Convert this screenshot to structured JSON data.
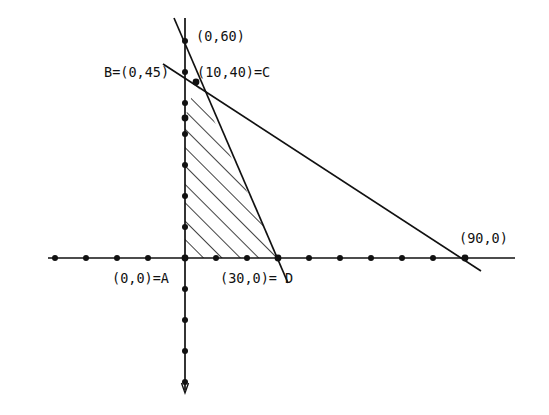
{
  "figure": {
    "width": 549,
    "height": 415,
    "background_color": "#ffffff",
    "line_color": "#111111",
    "text_color": "#111111"
  },
  "axes": {
    "origin_px": {
      "x": 185,
      "y": 258
    },
    "units_per_tick": 10,
    "pixels_per_tick": 31,
    "x_axis": {
      "name": "horizontal-axis",
      "start_px": 48,
      "end_px": 515,
      "tick_dot_positions_px": [
        55,
        86,
        117,
        148,
        185,
        216,
        247,
        278,
        309,
        340,
        371,
        402,
        433,
        465
      ],
      "has_arrow": false
    },
    "y_axis": {
      "name": "vertical-axis",
      "top_px": 18,
      "bottom_px": 393,
      "tick_dot_positions_px": [
        41,
        72,
        103,
        134,
        165,
        196,
        227,
        289,
        320,
        351,
        382
      ],
      "has_arrow": true,
      "arrow_direction": "down"
    }
  },
  "labels": [
    {
      "id": "label-0-60",
      "text": "(0,60)",
      "x": 196,
      "y": 30,
      "anchor": "left"
    },
    {
      "id": "label-b",
      "text": "B=(0,45)",
      "x": 104,
      "y": 66,
      "anchor": "left"
    },
    {
      "id": "label-c",
      "text": "(10,40)=C",
      "x": 197,
      "y": 66,
      "anchor": "left"
    },
    {
      "id": "label-a",
      "text": "(0,0)=A",
      "x": 112,
      "y": 272,
      "anchor": "left"
    },
    {
      "id": "label-d",
      "text": "(30,0)= D",
      "x": 220,
      "y": 272,
      "anchor": "left"
    },
    {
      "id": "label-90-0",
      "text": "(90,0)",
      "x": 459,
      "y": 232,
      "anchor": "left"
    }
  ],
  "constraint_lines": [
    {
      "id": "line-through-0-60-and-30-0",
      "name": "steep-constraint-line",
      "description": "Line from (0,60) down through (30,0)=D",
      "from_px": {
        "x": 174,
        "y": 18
      },
      "to_px": {
        "x": 288,
        "y": 283
      }
    },
    {
      "id": "line-through-0-45-and-90-0",
      "name": "shallow-constraint-line",
      "description": "Line from (0,45)=B down through (90,0)",
      "from_px": {
        "x": 163,
        "y": 64
      },
      "to_px": {
        "x": 481,
        "y": 271
      }
    }
  ],
  "vertices": [
    {
      "id": "vertex-a",
      "label": "A",
      "coords": "(0,0)",
      "x_px": 185,
      "y_px": 258
    },
    {
      "id": "vertex-b",
      "label": "B",
      "coords": "(0,45)",
      "x_px": 185,
      "y_px": 118
    },
    {
      "id": "vertex-c",
      "label": "C",
      "coords": "(10,40)",
      "x_px": 196,
      "y_px": 82
    },
    {
      "id": "vertex-d",
      "label": "D",
      "coords": "(30,0)",
      "x_px": 278,
      "y_px": 258
    }
  ],
  "feasible_region": {
    "name": "shaded-feasible-region",
    "fill_style": "diagonal-hatch",
    "hatch_angle_deg": 45,
    "hatch_spacing_px": 13,
    "polygon_points_px": "185,258 185,118 196,82 278,258"
  },
  "chart_data": {
    "type": "line",
    "xlabel": "",
    "ylabel": "",
    "xlim": [
      -44,
      106
    ],
    "ylim": [
      -42,
      77
    ],
    "grid": false,
    "legend": null,
    "series": [
      {
        "name": "Constraint 1: through (0,60) and (30,0)",
        "x": [
          0,
          30
        ],
        "y": [
          60,
          0
        ]
      },
      {
        "name": "Constraint 2: through (0,45) and (90,0)",
        "x": [
          0,
          90
        ],
        "y": [
          45,
          0
        ]
      }
    ],
    "annotations": [
      {
        "text": "(0,60)",
        "x": 0,
        "y": 60
      },
      {
        "text": "B=(0,45)",
        "x": 0,
        "y": 45
      },
      {
        "text": "(10,40)=C",
        "x": 10,
        "y": 40
      },
      {
        "text": "(0,0)=A",
        "x": 0,
        "y": 0
      },
      {
        "text": "(30,0)= D",
        "x": 30,
        "y": 0
      },
      {
        "text": "(90,0)",
        "x": 90,
        "y": 0
      }
    ],
    "shaded_polygon": {
      "label": "Feasible region A-B-C-D",
      "x": [
        0,
        0,
        10,
        30
      ],
      "y": [
        0,
        45,
        40,
        0
      ]
    },
    "xticks": [
      -40,
      -30,
      -20,
      -10,
      0,
      10,
      20,
      30,
      40,
      50,
      60,
      70,
      80,
      90
    ],
    "yticks": [
      70,
      60,
      50,
      40,
      30,
      20,
      10,
      -10,
      -20,
      -30,
      -40
    ]
  }
}
